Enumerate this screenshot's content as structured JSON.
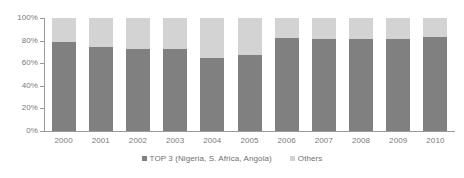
{
  "chart_data": {
    "type": "bar",
    "subtype": "stacked-100-percent",
    "title": "",
    "xlabel": "",
    "ylabel": "",
    "ylim": [
      0,
      100
    ],
    "ytick_labels": [
      "0%",
      "20%",
      "40%",
      "60%",
      "80%",
      "100%"
    ],
    "ytick_values": [
      0,
      20,
      40,
      60,
      80,
      100
    ],
    "grid": false,
    "legend_position": "bottom-center",
    "categories": [
      "2000",
      "2001",
      "2002",
      "2003",
      "2004",
      "2005",
      "2006",
      "2007",
      "2008",
      "2009",
      "2010"
    ],
    "series": [
      {
        "name": "TOP 3 (Nigeria, S. Africa, Angola)",
        "color": "#808080",
        "values": [
          79,
          74,
          73,
          73,
          65,
          67,
          82,
          81,
          81,
          81,
          83
        ]
      },
      {
        "name": "Others",
        "color": "#d3d3d3",
        "values": [
          21,
          26,
          27,
          27,
          35,
          33,
          18,
          19,
          19,
          19,
          17
        ]
      }
    ]
  },
  "legend": {
    "items": [
      {
        "label": "TOP 3 (Nigeria, S. Africa, Angola)",
        "swatch_name": "legend-swatch-top3"
      },
      {
        "label": "Others",
        "swatch_name": "legend-swatch-others"
      }
    ]
  },
  "colors": {
    "series_top3": "#808080",
    "series_others": "#d3d3d3",
    "axis": "#9a9a9a",
    "text": "#7a7a7a",
    "background": "#ffffff"
  }
}
